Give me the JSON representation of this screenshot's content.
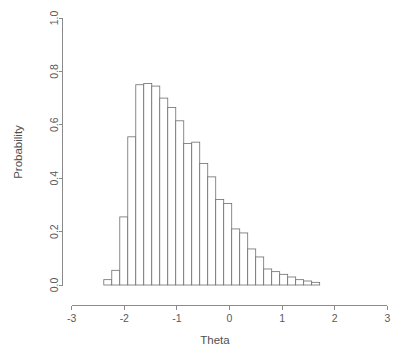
{
  "chart_data": {
    "type": "bar",
    "title": "",
    "subtitle": "",
    "xlabel": "Theta",
    "ylabel": "Probability",
    "xlim": [
      -3,
      3
    ],
    "ylim": [
      0,
      1.0
    ],
    "grid": false,
    "legend": null,
    "x_ticks": [
      "-3",
      "-2",
      "-1",
      "0",
      "1",
      "2",
      "3"
    ],
    "x_tick_values": [
      -3,
      -2,
      -1,
      0,
      1,
      2,
      3
    ],
    "y_ticks": [
      "0.0",
      "0.2",
      "0.4",
      "0.6",
      "0.8",
      "1.0"
    ],
    "y_tick_values": [
      0.0,
      0.2,
      0.4,
      0.6,
      0.8,
      1.0
    ],
    "bin_width": 0.152,
    "bin_starts": [
      -2.39,
      -2.238,
      -2.086,
      -1.934,
      -1.782,
      -1.63,
      -1.478,
      -1.326,
      -1.174,
      -1.022,
      -0.87,
      -0.718,
      -0.566,
      -0.414,
      -0.262,
      -0.11,
      0.042,
      0.194,
      0.346,
      0.498,
      0.65,
      0.802,
      0.954,
      1.106,
      1.258,
      1.41,
      1.562
    ],
    "bin_centers": [
      -2.314,
      -2.162,
      -2.01,
      -1.858,
      -1.706,
      -1.554,
      -1.402,
      -1.25,
      -1.098,
      -0.946,
      -0.794,
      -0.642,
      -0.49,
      -0.338,
      -0.186,
      -0.034,
      0.118,
      0.27,
      0.422,
      0.574,
      0.726,
      0.878,
      1.03,
      1.182,
      1.334,
      1.486,
      1.638
    ],
    "categories": [
      "-2.31",
      "-2.16",
      "-2.01",
      "-1.86",
      "-1.71",
      "-1.55",
      "-1.40",
      "-1.25",
      "-1.10",
      "-0.95",
      "-0.79",
      "-0.64",
      "-0.49",
      "-0.34",
      "-0.19",
      "-0.03",
      "0.12",
      "0.27",
      "0.42",
      "0.57",
      "0.73",
      "0.88",
      "1.03",
      "1.18",
      "1.33",
      "1.49",
      "1.64"
    ],
    "values": [
      0.02,
      0.055,
      0.255,
      0.555,
      0.75,
      0.755,
      0.745,
      0.7,
      0.665,
      0.615,
      0.53,
      0.535,
      0.455,
      0.405,
      0.32,
      0.305,
      0.21,
      0.195,
      0.135,
      0.105,
      0.06,
      0.05,
      0.04,
      0.03,
      0.02,
      0.015,
      0.01
    ],
    "series": [
      {
        "name": "Probability",
        "values": [
          0.02,
          0.055,
          0.255,
          0.555,
          0.75,
          0.755,
          0.745,
          0.7,
          0.665,
          0.615,
          0.53,
          0.535,
          0.455,
          0.405,
          0.32,
          0.305,
          0.21,
          0.195,
          0.135,
          0.105,
          0.06,
          0.05,
          0.04,
          0.03,
          0.02,
          0.015,
          0.01
        ]
      }
    ],
    "colors": {
      "bar_fill": "#ffffff",
      "bar_stroke": "#6e6e6e",
      "axis": "#8a8a8a",
      "text": "#5a5a5a",
      "background": "#ffffff"
    }
  }
}
